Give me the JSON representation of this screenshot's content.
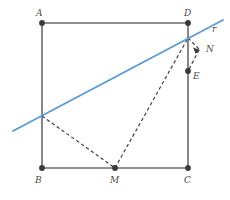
{
  "figure": {
    "canvas": {
      "width": 230,
      "height": 200
    },
    "colors": {
      "square_stroke": "#6b6b6b",
      "vertex_fill": "#3a3a3a",
      "line_r_stroke": "#5a9bd4",
      "dashed_stroke": "#3a3a3a",
      "label_text": "#4a4a4a",
      "background": "#ffffff"
    },
    "square": {
      "name": "ABCD",
      "vertices": [
        {
          "label": "A",
          "x": 42,
          "y": 23,
          "label_x": 36,
          "label_y": 9
        },
        {
          "label": "D",
          "x": 188,
          "y": 23,
          "label_x": 184,
          "label_y": 9
        },
        {
          "label": "C",
          "x": 188,
          "y": 168,
          "label_x": 184,
          "label_y": 176
        },
        {
          "label": "B",
          "x": 42,
          "y": 168,
          "label_x": 35,
          "label_y": 176
        }
      ]
    },
    "points": [
      {
        "label": "M",
        "x": 115,
        "y": 168,
        "label_x": 110,
        "label_y": 176,
        "on": "BC"
      },
      {
        "label": "E",
        "x": 188,
        "y": 71,
        "label_x": 193,
        "label_y": 72,
        "on": "DC"
      },
      {
        "label": "N",
        "x": 200,
        "y": 50,
        "label_x": 206,
        "label_y": 47,
        "on": "free"
      }
    ],
    "line_r": {
      "label": "r",
      "x1": 13,
      "y1": 131,
      "x2": 223,
      "y2": 20,
      "label_x": 212,
      "label_y": 26,
      "intersect_ab": {
        "x": 42,
        "y": 116
      },
      "intersect_dc": {
        "x": 188,
        "y": 38
      }
    },
    "dashed_segments": [
      {
        "name": "P-to-M",
        "x1": 42,
        "y1": 116,
        "x2": 115,
        "y2": 168
      },
      {
        "name": "M-to-D",
        "x1": 115,
        "y1": 168,
        "x2": 188,
        "y2": 38
      },
      {
        "name": "D-to-N",
        "x1": 188,
        "y1": 38,
        "x2": 200,
        "y2": 50
      },
      {
        "name": "N-to-E",
        "x1": 200,
        "y1": 50,
        "x2": 188,
        "y2": 71
      }
    ],
    "arrow_marks": [
      {
        "name": "arrow-to-N",
        "x": 200,
        "y": 50
      }
    ]
  }
}
